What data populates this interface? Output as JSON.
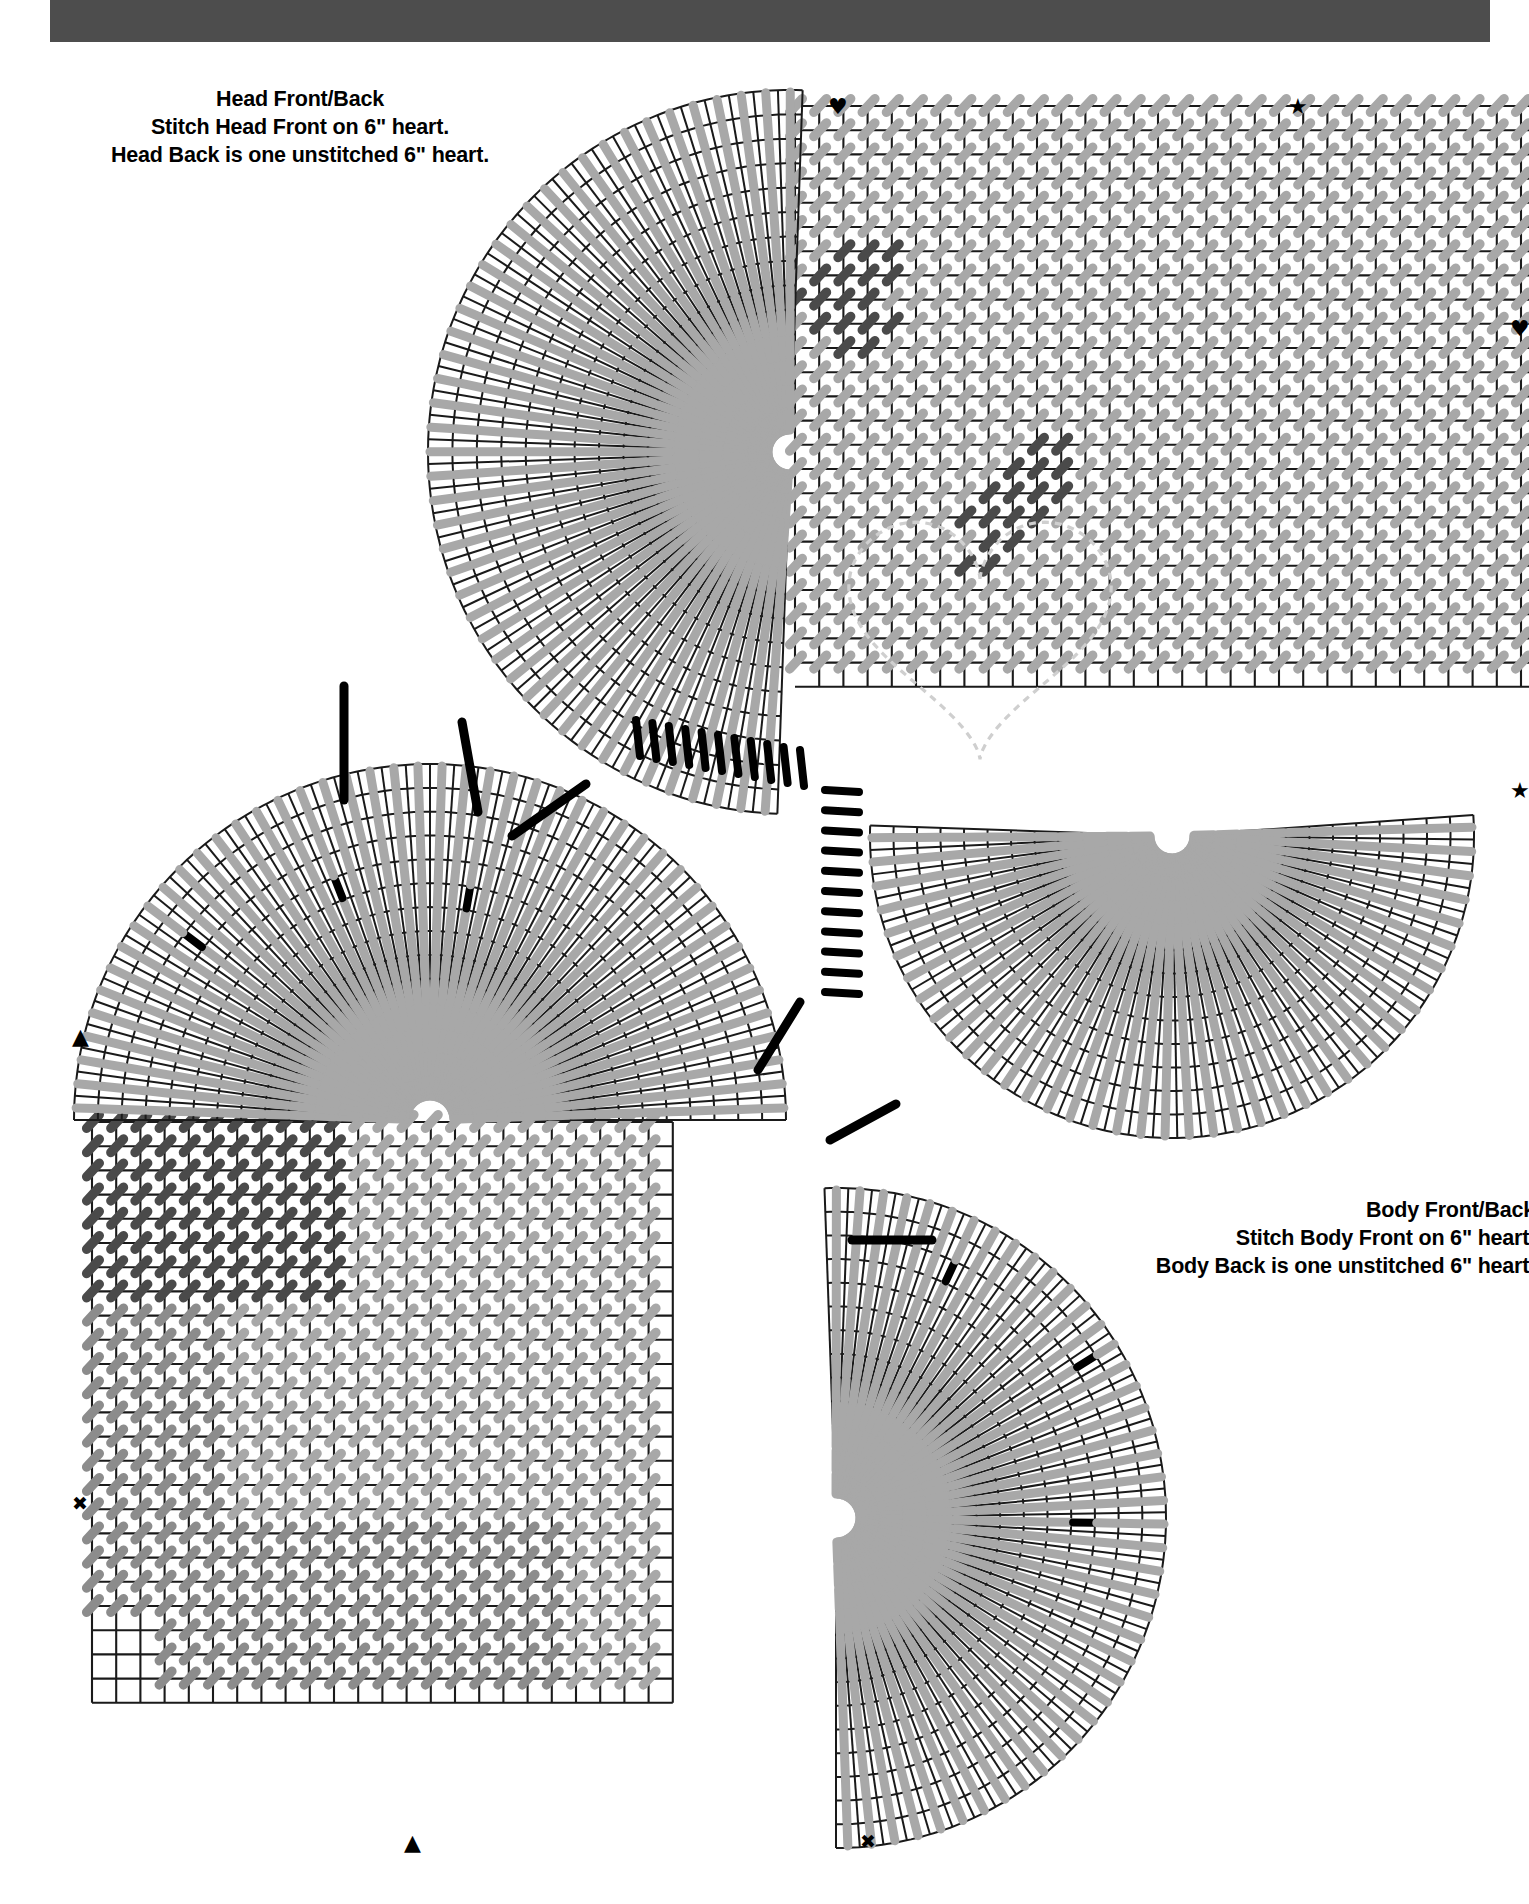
{
  "document": {
    "type": "plastic-canvas-stitch-chart",
    "background_color": "#ffffff",
    "top_bar_color": "#4d4d4d"
  },
  "captions": {
    "head": {
      "name": "head-front-back-caption",
      "lines": [
        "Head Front/Back",
        "Stitch Head Front on 6\" heart.",
        "Head Back is one unstitched 6\" heart."
      ]
    },
    "body": {
      "name": "body-front-back-caption",
      "lines": [
        "Body Front/Back",
        "Stitch Body Front on 6\" heart.",
        "Body Back is one unstitched 6\" heart."
      ]
    }
  },
  "markers": [
    {
      "name": "marker-heart-head-top",
      "glyph": "♥",
      "x": 828,
      "y": 96
    },
    {
      "name": "marker-star-head-top",
      "glyph": "★",
      "x": 1288,
      "y": 96
    },
    {
      "name": "marker-heart-head-right",
      "glyph": "♥",
      "x": 1510,
      "y": 318
    },
    {
      "name": "marker-star-head-right",
      "glyph": "★",
      "x": 1510,
      "y": 780
    },
    {
      "name": "marker-triangle-body-left",
      "glyph": "▲",
      "x": 72,
      "y": 1026
    },
    {
      "name": "marker-asterisk-body-left",
      "glyph": "✖",
      "x": 72,
      "y": 1494
    },
    {
      "name": "marker-triangle-body-bottom",
      "glyph": "▲",
      "x": 404,
      "y": 1832
    },
    {
      "name": "marker-asterisk-body-bottom",
      "glyph": "✖",
      "x": 860,
      "y": 1832
    }
  ],
  "chart_data": {
    "type": "diagram",
    "charts": [
      {
        "name": "head-front-back",
        "shape": "heart",
        "size_label": "6\" heart",
        "grid": {
          "cell_px": 24.2,
          "origin_x": 795,
          "origin_y": 106,
          "cols": 31,
          "rows": 24
        },
        "fan_centers": [
          {
            "cx": 790,
            "cy": 452,
            "r_inner": 20,
            "r_outer": 362,
            "a0": 92,
            "a1": 272,
            "rings": 14,
            "spokes": 46
          },
          {
            "cx": 1172,
            "cy": 836,
            "r_inner": 20,
            "r_outer": 302,
            "a0": -4,
            "a1": 182,
            "rings": 12,
            "spokes": 40
          }
        ],
        "stitch_regions": [
          {
            "name": "eye-left",
            "color": "#4a4a4a",
            "cells": 22
          },
          {
            "name": "eye-right",
            "color": "#4a4a4a",
            "cells": 26
          }
        ],
        "accent_color": "#000000",
        "field_color": "#a8a8a8"
      },
      {
        "name": "body-front-back",
        "shape": "heart",
        "size_label": "6\" heart",
        "grid": {
          "cell_px": 24.2,
          "origin_x": 92,
          "origin_y": 1122,
          "cols": 24,
          "rows": 24
        },
        "fan_centers": [
          {
            "cx": 430,
            "cy": 1120,
            "r_inner": 22,
            "r_outer": 356,
            "a0": 180,
            "a1": 360,
            "rings": 14,
            "spokes": 46
          },
          {
            "cx": 836,
            "cy": 1518,
            "r_inner": 22,
            "r_outer": 330,
            "a0": -92,
            "a1": 90,
            "rings": 13,
            "spokes": 44
          }
        ],
        "accent_color": "#000000",
        "field_color": "#a8a8a8"
      }
    ],
    "legend": {
      "light_gray": "Continental / half-cross stitch (background color)",
      "dark_gray": "Contrast color stitch (face detail)",
      "black": "Straight accent stitch"
    }
  }
}
